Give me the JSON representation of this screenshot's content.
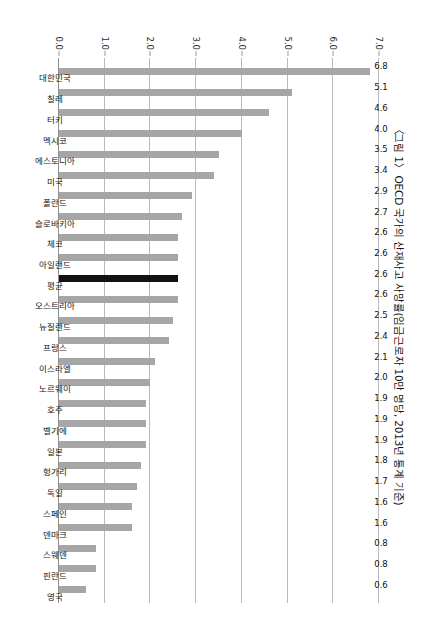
{
  "chart_data": {
    "type": "bar",
    "title": "〈그림 1〉 OECD 국가의 산재사고 사망률(임금근로자 10만 명당, 2013년 통계 기준)",
    "xlabel": "",
    "ylabel": "",
    "ylim": [
      0.0,
      7.0
    ],
    "grid": true,
    "legend": "none",
    "orientation": "vertical-bars-on-rotated-page",
    "y_ticks": [
      "0.0",
      "1.0",
      "2.0",
      "3.0",
      "4.0",
      "5.0",
      "6.0",
      "7.0"
    ],
    "y_tick_values": [
      0.0,
      1.0,
      2.0,
      3.0,
      4.0,
      5.0,
      6.0,
      7.0
    ],
    "categories": [
      "대한민국",
      "칠레",
      "터키",
      "멕시코",
      "에스토니아",
      "미국",
      "폴란드",
      "슬로바키아",
      "체코",
      "아일랜드",
      "평균",
      "오스트리아",
      "뉴질랜드",
      "프랑스",
      "이스라엘",
      "노르웨이",
      "호주",
      "벨기에",
      "일본",
      "헝가리",
      "독일",
      "스페인",
      "덴마크",
      "스웨덴",
      "핀란드",
      "영국"
    ],
    "values": [
      6.8,
      5.1,
      4.6,
      4.0,
      3.5,
      3.4,
      2.9,
      2.7,
      2.6,
      2.6,
      2.6,
      2.6,
      2.5,
      2.4,
      2.1,
      2.0,
      1.9,
      1.9,
      1.9,
      1.8,
      1.7,
      1.6,
      1.6,
      0.8,
      0.8,
      0.6
    ],
    "value_labels": [
      "6.8",
      "5.1",
      "4.6",
      "4.0",
      "3.5",
      "3.4",
      "2.9",
      "2.7",
      "2.6",
      "2.6",
      "2.6",
      "2.6",
      "2.5",
      "2.4",
      "2.1",
      "2.0",
      "1.9",
      "1.9",
      "1.9",
      "1.8",
      "1.7",
      "1.6",
      "1.6",
      "0.8",
      "0.8",
      "0.6"
    ],
    "highlight_index": 10,
    "highlight_label": "평균",
    "colors": {
      "bar": "#a6a6a6",
      "bar_highlight": "#111111",
      "gridline": "#b9b9b9",
      "text": "#141414",
      "background": "#ffffff"
    }
  }
}
